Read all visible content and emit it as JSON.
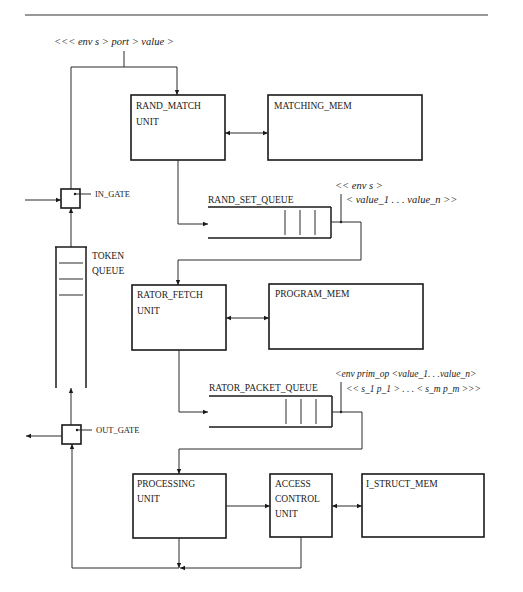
{
  "diagram": {
    "type": "dataflow-architecture-block-diagram",
    "input_token_label": "<<< env s > port > value >",
    "units": [
      {
        "id": "rand_match",
        "line1": "RAND_MATCH",
        "line2": "UNIT"
      },
      {
        "id": "matching_mem",
        "line1": "MATCHING_MEM"
      },
      {
        "id": "rator_fetch",
        "line1": "RATOR_FETCH",
        "line2": "UNIT"
      },
      {
        "id": "program_mem",
        "line1": "PROGRAM_MEM"
      },
      {
        "id": "processing",
        "line1": "PROCESSING",
        "line2": "UNIT"
      },
      {
        "id": "access_control",
        "line1": "ACCESS",
        "line2": "CONTROL",
        "line3": "UNIT"
      },
      {
        "id": "i_struct_mem",
        "line1": "I_STRUCT_MEM"
      }
    ],
    "queues": {
      "rand_set_queue": {
        "label": "RAND_SET_QUEUE",
        "packet_line1": "<< env s >",
        "packet_line2": "< value_1 . . . value_n >>"
      },
      "rator_packet_queue": {
        "label": "RATOR_PACKET_QUEUE",
        "packet_line1": "<env prim_op <value_1. . .value_n>",
        "packet_line2": "<< s_1 p_1 > . . . < s_m p_m >>>"
      },
      "token_queue": {
        "line1": "TOKEN",
        "line2": "QUEUE"
      }
    },
    "gates": {
      "in_gate": "IN_GATE",
      "out_gate": "OUT_GATE"
    }
  }
}
